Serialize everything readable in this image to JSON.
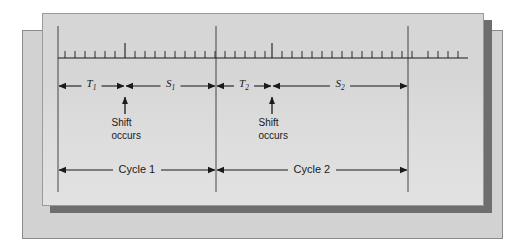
{
  "figure": {
    "name": "clock-cycle-shift-timing-diagram",
    "background_color": "#ffffff",
    "outer_frame_color": "#d2d2d2",
    "panel_color": "#d6d6d6",
    "shadow_color": "#6e6e6e",
    "ink_color": "#1a1a1a"
  },
  "labels": {
    "t1": "T",
    "t1_sub": "1",
    "s1": "S",
    "s1_sub": "1",
    "t2": "T",
    "t2_sub": "2",
    "s2": "S",
    "s2_sub": "2",
    "cycle1": "Cycle 1",
    "cycle2": "Cycle 2",
    "shift_line1": "Shift",
    "shift_line2": "occurs"
  },
  "icons": {
    "arrow_left": "left-arrowhead-icon",
    "arrow_right": "right-arrowhead-icon",
    "arrow_up": "up-arrowhead-icon",
    "tick": "ruler-tick-icon",
    "boundary": "cycle-boundary-line-icon"
  },
  "chart_data": {
    "type": "timing-diagram",
    "title": "",
    "xlabel": "",
    "ylabel": "",
    "axis": {
      "x_start": 58,
      "x_end": 468,
      "baseline_y": 58,
      "grid": false,
      "tick_spacing": 10,
      "minor_tick_height": 7,
      "major_tick_height": 15
    },
    "boundaries": [
      {
        "name": "cycle-1-start",
        "x": 58
      },
      {
        "name": "cycle-1-end-cycle-2-start",
        "x": 216
      },
      {
        "name": "cycle-2-end",
        "x": 408
      }
    ],
    "shift_points": [
      {
        "name": "shift-occurs-1",
        "x": 125
      },
      {
        "name": "shift-occurs-2",
        "x": 272
      }
    ],
    "intervals": [
      {
        "label": "T1",
        "start": 58,
        "end": 125,
        "row": "interval"
      },
      {
        "label": "S1",
        "start": 125,
        "end": 216,
        "row": "interval"
      },
      {
        "label": "T2",
        "start": 216,
        "end": 272,
        "row": "interval"
      },
      {
        "label": "S2",
        "start": 272,
        "end": 408,
        "row": "interval"
      },
      {
        "label": "Cycle 1",
        "start": 58,
        "end": 216,
        "row": "cycle"
      },
      {
        "label": "Cycle 2",
        "start": 216,
        "end": 408,
        "row": "cycle"
      }
    ],
    "ticks": [
      {
        "x": 65,
        "major": false
      },
      {
        "x": 75,
        "major": false
      },
      {
        "x": 85,
        "major": false
      },
      {
        "x": 95,
        "major": false
      },
      {
        "x": 105,
        "major": false
      },
      {
        "x": 115,
        "major": false
      },
      {
        "x": 125,
        "major": true
      },
      {
        "x": 135,
        "major": false
      },
      {
        "x": 145,
        "major": false
      },
      {
        "x": 155,
        "major": false
      },
      {
        "x": 165,
        "major": false
      },
      {
        "x": 175,
        "major": false
      },
      {
        "x": 185,
        "major": false
      },
      {
        "x": 195,
        "major": false
      },
      {
        "x": 205,
        "major": false
      },
      {
        "x": 215,
        "major": false
      },
      {
        "x": 225,
        "major": false
      },
      {
        "x": 235,
        "major": false
      },
      {
        "x": 245,
        "major": false
      },
      {
        "x": 255,
        "major": false
      },
      {
        "x": 265,
        "major": false
      },
      {
        "x": 272,
        "major": true
      },
      {
        "x": 282,
        "major": false
      },
      {
        "x": 292,
        "major": false
      },
      {
        "x": 302,
        "major": false
      },
      {
        "x": 312,
        "major": false
      },
      {
        "x": 322,
        "major": false
      },
      {
        "x": 332,
        "major": false
      },
      {
        "x": 342,
        "major": false
      },
      {
        "x": 352,
        "major": false
      },
      {
        "x": 362,
        "major": false
      },
      {
        "x": 372,
        "major": false
      },
      {
        "x": 382,
        "major": false
      },
      {
        "x": 392,
        "major": false
      },
      {
        "x": 402,
        "major": false
      },
      {
        "x": 412,
        "major": false
      },
      {
        "x": 428,
        "major": false
      },
      {
        "x": 438,
        "major": false
      },
      {
        "x": 448,
        "major": false
      },
      {
        "x": 458,
        "major": false
      }
    ],
    "rows": {
      "interval_arrow_y": 86,
      "shift_arrow_top": 97,
      "shift_arrow_bottom": 114,
      "shift_text_y": 117,
      "cycle_arrow_y": 170
    }
  }
}
